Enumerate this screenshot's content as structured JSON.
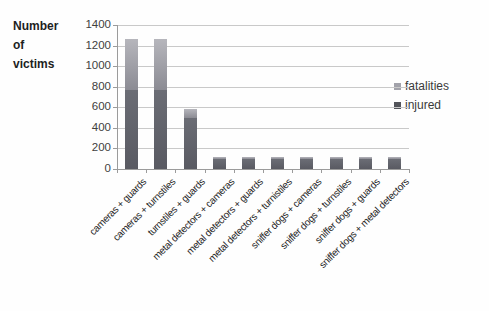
{
  "title": "Number\nof\nvictims",
  "legend": [
    {
      "label": "fatalities",
      "color": "#a2a2aa"
    },
    {
      "label": "injured",
      "color": "#53545a"
    }
  ],
  "chart_data": {
    "type": "bar",
    "stacked": true,
    "title": "",
    "xlabel": "",
    "ylabel": "Number of victims",
    "ylim": [
      0,
      1400
    ],
    "ytick_step": 200,
    "yticks": [
      0,
      200,
      400,
      600,
      800,
      1000,
      1200,
      1400
    ],
    "grid": true,
    "legend_position": "right",
    "categories": [
      "cameras + guards",
      "cameras + turnstiles",
      "turnstiles + guards",
      "metal detectors + cameras",
      "metal detectors + guards",
      "metal detectors + turnistiles",
      "sniffer dogs + cameras",
      "sniffer dogs + turnstiles",
      "sniffer dogs + guards",
      "sniffer dogs + metal detectors"
    ],
    "series": [
      {
        "name": "injured",
        "values": [
          770,
          770,
          500,
          100,
          100,
          100,
          100,
          100,
          100,
          100
        ],
        "color_top": "#6b6d75",
        "color_bottom": "#595a62"
      },
      {
        "name": "fatalities",
        "values": [
          490,
          490,
          80,
          20,
          20,
          20,
          20,
          20,
          20,
          20
        ],
        "color_top": "#b6b6bc",
        "color_bottom": "#8b8b93"
      }
    ]
  }
}
